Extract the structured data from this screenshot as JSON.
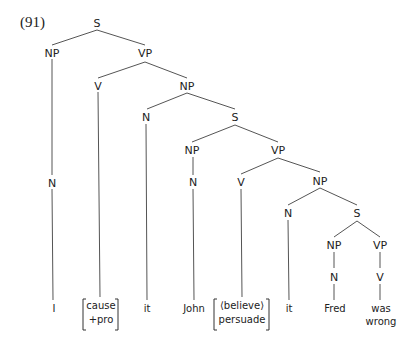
{
  "example_number": "(91)",
  "nodes": {
    "s1": "S",
    "np1": "NP",
    "vp1": "VP",
    "n1": "N",
    "v1": "V",
    "np2": "NP",
    "n2": "N",
    "s2": "S",
    "np3": "NP",
    "n3": "N",
    "vp2": "VP",
    "v2": "V",
    "np4": "NP",
    "n4": "N",
    "s3": "S",
    "np5": "NP",
    "n5": "N",
    "vp3": "VP",
    "v3": "V"
  },
  "leaves": {
    "i": "I",
    "cause_top": "cause",
    "cause_bottom": "+pro",
    "it1": "it",
    "john": "John",
    "believe_top": "⟨believe⟩",
    "believe_bottom": "persuade",
    "it2": "it",
    "fred": "Fred",
    "was_wrong_top": "was",
    "was_wrong_bottom": "wrong"
  }
}
